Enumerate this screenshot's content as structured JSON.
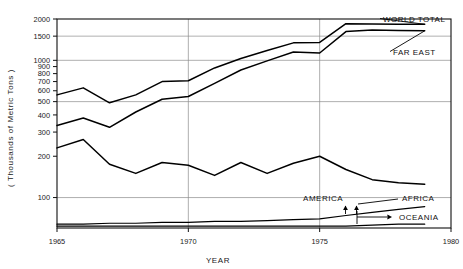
{
  "chart_data": {
    "type": "line",
    "title": "",
    "xlabel": "YEAR",
    "ylabel": "( Thousands of Metric Tons )",
    "yscale": "log",
    "ylim": [
      60,
      2000
    ],
    "xlim": [
      1965,
      1980
    ],
    "grid": "both",
    "legend_position": "inline-right-labels",
    "x_ticks": [
      "1965",
      "1970",
      "1975",
      "1980"
    ],
    "y_ticks": [
      "2000",
      "1500",
      "1000",
      "900",
      "800",
      "700",
      "600",
      "500",
      "400",
      "300",
      "200",
      "100"
    ],
    "y_gridlines": [
      1500,
      1000,
      500,
      100
    ],
    "x_gridlines": [
      1970,
      1975
    ],
    "x": [
      1965,
      1966,
      1967,
      1968,
      1969,
      1970,
      1971,
      1972,
      1973,
      1974,
      1975,
      1976,
      1977,
      1978,
      1979
    ],
    "series": [
      {
        "name": "WORLD TOTAL",
        "label": "WORLD TOTAL",
        "values": [
          560,
          630,
          490,
          560,
          700,
          710,
          880,
          1030,
          1180,
          1340,
          1350,
          1850,
          1840,
          1830,
          1830
        ]
      },
      {
        "name": "FAR EAST",
        "label": "FAR EAST",
        "values": [
          335,
          380,
          325,
          420,
          520,
          545,
          680,
          850,
          990,
          1150,
          1130,
          1620,
          1660,
          1650,
          1640
        ]
      },
      {
        "name": "AMERICA",
        "label": "AMERICA",
        "values": [
          230,
          265,
          175,
          150,
          180,
          172,
          145,
          180,
          150,
          178,
          200,
          160,
          135,
          128,
          125
        ]
      },
      {
        "name": "AFRICA",
        "label": "AFRICA",
        "values": [
          64,
          64,
          65,
          65,
          66,
          66,
          67,
          67,
          68,
          69,
          70,
          74,
          78,
          82,
          86
        ]
      },
      {
        "name": "OCEANIA",
        "label": "OCEANIA",
        "values": [
          62,
          62,
          62,
          62,
          62,
          62,
          62,
          62,
          62,
          62,
          62,
          62,
          63,
          64,
          64
        ]
      }
    ]
  },
  "axis": {
    "y_title": "( Thousands of Metric Tons )",
    "x_title": "YEAR"
  },
  "ticks": {
    "y": [
      "2000",
      "1500",
      "1000",
      "900",
      "800",
      "700",
      "600",
      "500",
      "400",
      "300",
      "200",
      "100"
    ],
    "x": [
      "1965",
      "1970",
      "1975",
      "1980"
    ]
  },
  "labels": {
    "world_total": "WORLD TOTAL",
    "far_east": "FAR EAST",
    "america": "AMERICA",
    "africa": "AFRICA",
    "oceania": "OCEANIA"
  },
  "colors": {
    "line": "#000000",
    "grid": "#8d8d8d",
    "frame": "#101010",
    "background": "#ffffff"
  }
}
